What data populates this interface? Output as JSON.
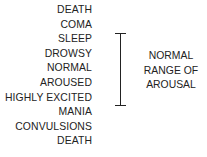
{
  "diagram": {
    "states": [
      "DEATH",
      "COMA",
      "SLEEP",
      "DROWSY",
      "NORMAL",
      "AROUSED",
      "HIGHLY EXCITED",
      "MANIA",
      "CONVULSIONS",
      "DEATH"
    ],
    "range_label": [
      "NORMAL",
      "RANGE OF",
      "AROUSAL"
    ],
    "range_spans": {
      "from": "SLEEP",
      "to": "HIGHLY EXCITED"
    }
  }
}
